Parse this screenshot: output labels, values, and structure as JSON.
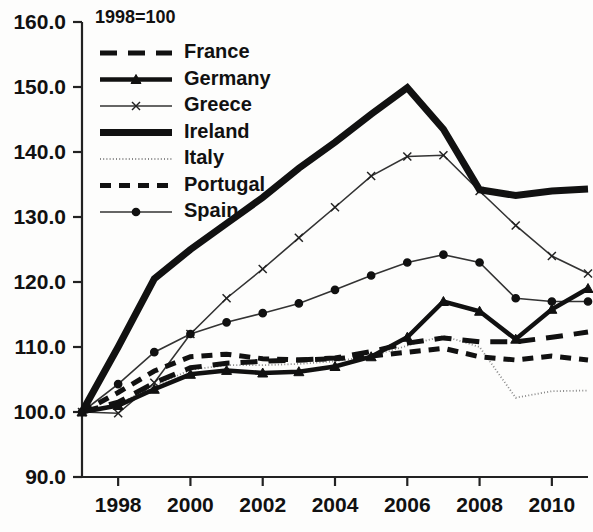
{
  "chart_data": {
    "type": "line",
    "title": "1998=100",
    "xlabel": "",
    "ylabel": "",
    "xlim": [
      1997,
      2011
    ],
    "ylim": [
      90.0,
      160.0
    ],
    "grid": false,
    "legend_position": "top-left-inside",
    "x_tick_labels": [
      "1998",
      "2000",
      "2002",
      "2004",
      "2006",
      "2008",
      "2010"
    ],
    "x_ticks": [
      1998,
      2000,
      2002,
      2004,
      2006,
      2008,
      2010
    ],
    "y_tick_labels": [
      "90.0",
      "100.0",
      "110.0",
      "120.0",
      "130.0",
      "140.0",
      "150.0",
      "160.0"
    ],
    "y_ticks": [
      90.0,
      100.0,
      110.0,
      120.0,
      130.0,
      140.0,
      150.0,
      160.0
    ],
    "x": [
      1997,
      1998,
      1999,
      2000,
      2001,
      2002,
      2003,
      2004,
      2005,
      2006,
      2007,
      2008,
      2009,
      2010,
      2011
    ],
    "series": [
      {
        "name": "France",
        "style": "long-dash",
        "marker": "none",
        "color": "#111111",
        "width": 5,
        "dash": "17,11",
        "values": [
          100.0,
          101.5,
          104.5,
          106.8,
          107.5,
          107.8,
          108.0,
          108.3,
          109.3,
          110.6,
          111.4,
          110.8,
          110.8,
          111.5,
          112.3
        ]
      },
      {
        "name": "Germany",
        "style": "solid",
        "marker": "triangle",
        "color": "#111111",
        "width": 4.5,
        "dash": "none",
        "values": [
          100.0,
          101.0,
          103.5,
          105.8,
          106.4,
          106.0,
          106.2,
          107.0,
          108.5,
          111.5,
          117.0,
          115.5,
          111.2,
          115.8,
          119.0
        ]
      },
      {
        "name": "Greece",
        "style": "solid",
        "marker": "cross",
        "color": "#333333",
        "width": 1.6,
        "dash": "none",
        "values": [
          100.0,
          99.8,
          104.5,
          112.0,
          117.5,
          122.0,
          126.8,
          131.5,
          136.3,
          139.3,
          139.5,
          134.0,
          128.7,
          124.0,
          121.3
        ]
      },
      {
        "name": "Ireland",
        "style": "solid",
        "marker": "none",
        "color": "#111111",
        "width": 7,
        "dash": "none",
        "values": [
          100.0,
          110.0,
          120.5,
          125.0,
          129.0,
          133.0,
          137.5,
          141.5,
          145.8,
          149.9,
          143.5,
          134.2,
          133.3,
          134.0,
          134.3
        ]
      },
      {
        "name": "Italy",
        "style": "dotted",
        "marker": "none",
        "color": "#888888",
        "width": 1.8,
        "dash": "1,2.2",
        "values": [
          100.0,
          101.2,
          104.0,
          106.5,
          107.2,
          107.2,
          107.4,
          107.8,
          108.6,
          110.2,
          111.7,
          110.0,
          102.2,
          103.2,
          103.3
        ]
      },
      {
        "name": "Portugal",
        "style": "dash",
        "marker": "none",
        "color": "#111111",
        "width": 5,
        "dash": "11,8"
      },
      {
        "name": "Spain",
        "style": "solid",
        "marker": "circle",
        "color": "#333333",
        "width": 1.6,
        "dash": "none",
        "values": [
          100.0,
          104.3,
          109.2,
          112.0,
          113.8,
          115.2,
          116.7,
          118.8,
          121.0,
          123.0,
          124.2,
          123.0,
          117.5,
          117.0,
          117.0
        ]
      }
    ],
    "portugal_values": [
      100.0,
      103.0,
      106.3,
      108.5,
      108.9,
      108.2,
      108.0,
      108.2,
      108.6,
      109.2,
      109.8,
      108.5,
      108.0,
      108.6,
      108.0
    ]
  },
  "legend": {
    "entries": [
      {
        "label": "France"
      },
      {
        "label": "Germany"
      },
      {
        "label": "Greece"
      },
      {
        "label": "Ireland"
      },
      {
        "label": "Italy"
      },
      {
        "label": "Portugal"
      },
      {
        "label": "Spain"
      }
    ]
  }
}
